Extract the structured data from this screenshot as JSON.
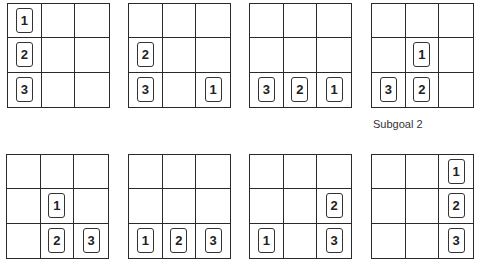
{
  "diagram": {
    "type": "tower-of-hanoi-style 3x3 grid state sequence",
    "boards": [
      {
        "id": 1,
        "x": 7,
        "y": 3,
        "tiles": [
          {
            "label": "1",
            "row": 0,
            "col": 0
          },
          {
            "label": "2",
            "row": 1,
            "col": 0
          },
          {
            "label": "3",
            "row": 2,
            "col": 0
          }
        ]
      },
      {
        "id": 2,
        "x": 128,
        "y": 3,
        "tiles": [
          {
            "label": "2",
            "row": 1,
            "col": 0
          },
          {
            "label": "3",
            "row": 2,
            "col": 0
          },
          {
            "label": "1",
            "row": 2,
            "col": 2
          }
        ]
      },
      {
        "id": 3,
        "x": 249,
        "y": 3,
        "tiles": [
          {
            "label": "3",
            "row": 2,
            "col": 0
          },
          {
            "label": "2",
            "row": 2,
            "col": 1
          },
          {
            "label": "1",
            "row": 2,
            "col": 2
          }
        ]
      },
      {
        "id": 4,
        "x": 371,
        "y": 3,
        "tiles": [
          {
            "label": "1",
            "row": 1,
            "col": 1
          },
          {
            "label": "3",
            "row": 2,
            "col": 0
          },
          {
            "label": "2",
            "row": 2,
            "col": 1
          }
        ],
        "caption": "Subgoal 2"
      },
      {
        "id": 5,
        "x": 6,
        "y": 154,
        "tiles": [
          {
            "label": "1",
            "row": 1,
            "col": 1
          },
          {
            "label": "2",
            "row": 2,
            "col": 1
          },
          {
            "label": "3",
            "row": 2,
            "col": 2
          }
        ]
      },
      {
        "id": 6,
        "x": 128,
        "y": 154,
        "tiles": [
          {
            "label": "1",
            "row": 2,
            "col": 0
          },
          {
            "label": "2",
            "row": 2,
            "col": 1
          },
          {
            "label": "3",
            "row": 2,
            "col": 2
          }
        ]
      },
      {
        "id": 7,
        "x": 249,
        "y": 154,
        "tiles": [
          {
            "label": "2",
            "row": 1,
            "col": 2
          },
          {
            "label": "1",
            "row": 2,
            "col": 0
          },
          {
            "label": "3",
            "row": 2,
            "col": 2
          }
        ]
      },
      {
        "id": 8,
        "x": 371,
        "y": 154,
        "tiles": [
          {
            "label": "1",
            "row": 0,
            "col": 2
          },
          {
            "label": "2",
            "row": 1,
            "col": 2
          },
          {
            "label": "3",
            "row": 2,
            "col": 2
          }
        ]
      }
    ],
    "captions": {
      "board4": "Subgoal 2"
    }
  }
}
